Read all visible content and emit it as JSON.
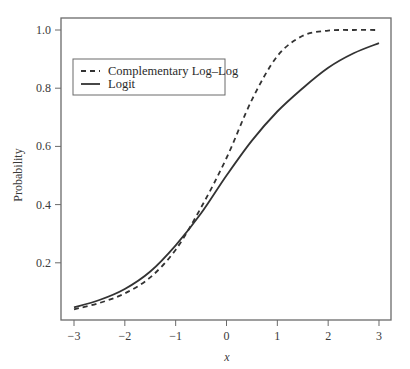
{
  "chart_data": {
    "type": "line",
    "title": "",
    "xlabel": "x",
    "ylabel": "Probability",
    "xlim": [
      -3,
      3
    ],
    "ylim": [
      0,
      1.0
    ],
    "grid": false,
    "legend_position": "upper-left",
    "x_ticks": [
      -3,
      -2,
      -1,
      0,
      1,
      2,
      3
    ],
    "x_tick_labels": [
      "−3",
      "−2",
      "−1",
      "0",
      "1",
      "2",
      "3"
    ],
    "y_ticks": [
      0.2,
      0.4,
      0.6,
      0.8,
      1.0
    ],
    "y_tick_labels": [
      "0.2",
      "0.4",
      "0.6",
      "0.8",
      "1.0"
    ],
    "x": [
      -3,
      -2.5,
      -2,
      -1.5,
      -1,
      -0.5,
      0,
      0.5,
      1,
      1.5,
      2,
      2.5,
      3
    ],
    "series": [
      {
        "name": "Complementary Log–Log",
        "style": "dashed",
        "color": "#333333",
        "values": [
          0.04,
          0.062,
          0.095,
          0.15,
          0.245,
          0.39,
          0.56,
          0.76,
          0.91,
          0.98,
          0.998,
          1.0,
          1.0
        ]
      },
      {
        "name": "Logit",
        "style": "solid",
        "color": "#333333",
        "values": [
          0.047,
          0.072,
          0.11,
          0.17,
          0.26,
          0.37,
          0.5,
          0.62,
          0.72,
          0.8,
          0.87,
          0.92,
          0.955
        ]
      }
    ]
  },
  "legend": {
    "items": [
      "Complementary Log–Log",
      "Logit"
    ]
  },
  "axes": {
    "xlabel": "x",
    "ylabel": "Probability"
  }
}
